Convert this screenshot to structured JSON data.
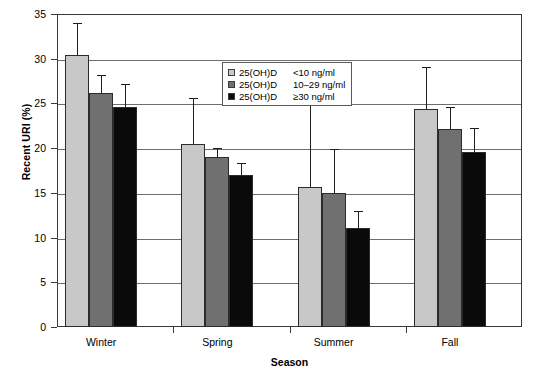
{
  "chart_data": {
    "type": "bar",
    "title": "",
    "xlabel": "Season",
    "ylabel": "Recent URI (%)",
    "categories": [
      "Winter",
      "Spring",
      "Summer",
      "Fall"
    ],
    "ylim": [
      0,
      35
    ],
    "yticks": [
      0,
      5,
      10,
      15,
      20,
      25,
      30,
      35
    ],
    "grid": true,
    "legend_position": "upper-center",
    "error_bars": "upper-only",
    "series": [
      {
        "name": "25(OH)D",
        "range": "<10 ng/ml",
        "color": "#c8c8c8",
        "values": [
          30.4,
          20.5,
          15.7,
          24.4
        ],
        "errors_upper": [
          34.0,
          25.6,
          25.6,
          29.1
        ]
      },
      {
        "name": "25(OH)D",
        "range": "10–29 ng/ml",
        "color": "#707070",
        "values": [
          26.2,
          19.0,
          15.0,
          22.1
        ],
        "errors_upper": [
          28.2,
          20.0,
          19.9,
          24.6
        ]
      },
      {
        "name": "25(OH)D",
        "range": "≥30 ng/ml",
        "color": "#0a0a0a",
        "values": [
          24.6,
          17.0,
          11.1,
          19.6
        ],
        "errors_upper": [
          27.2,
          18.3,
          13.0,
          22.2
        ]
      }
    ]
  },
  "axes": {
    "y_title": "Recent URI (%)",
    "x_title": "Season",
    "y_tick_labels": [
      "0",
      "5",
      "10",
      "15",
      "20",
      "25",
      "30",
      "35"
    ],
    "x_tick_labels": [
      "Winter",
      "Spring",
      "Summer",
      "Fall"
    ]
  },
  "legend": {
    "entries": [
      {
        "name": "25(OH)D",
        "range": "<10 ng/ml"
      },
      {
        "name": "25(OH)D",
        "range": "10–29 ng/ml"
      },
      {
        "name": "25(OH)D",
        "range": "≥30 ng/ml"
      }
    ]
  },
  "colors": {
    "series_low": "#c8c8c8",
    "series_mid": "#707070",
    "series_high": "#0a0a0a",
    "axis": "#3a3a3a",
    "grid": "#6e6e6e",
    "background": "#ffffff"
  }
}
